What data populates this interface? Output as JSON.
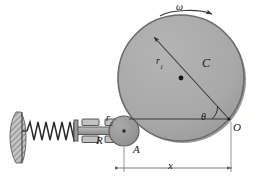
{
  "figure": {
    "background": "#ffffff",
    "width": 253,
    "height": 183
  },
  "colors": {
    "disc_fill": "#a9a9a9",
    "disc_edge": "#6e6e6e",
    "disc_shadow": "#8c8c8c",
    "roller_fill": "#9b9b9b",
    "rod_fill": "#a5a5a5",
    "rod_edge": "#555555",
    "block_fill": "#bdbdbd",
    "block_edge": "#4a4a4a",
    "wall_fill": "#bbbbbb",
    "wall_edge": "#555555",
    "spring_stroke": "#2b2b2b",
    "line_stroke": "#3a3a3a",
    "dim_stroke": "#6a6a6a",
    "text": "#1a1a1a"
  },
  "labels": {
    "omega": "ω",
    "r1_base": "r",
    "r1_sub": "1",
    "disc": "C",
    "theta": "θ",
    "origin": "O",
    "r2_base": "r",
    "r2_sub": "2",
    "rod": "R",
    "contact_point": "A",
    "displacement": "x"
  },
  "geometry": {
    "disc": {
      "cx": 181,
      "cy": 78,
      "r": 63
    },
    "disc_center_dot": {
      "cx": 181,
      "cy": 78,
      "r": 2
    },
    "point_O": {
      "x": 229,
      "y": 119
    },
    "roller": {
      "cx": 124,
      "cy": 131,
      "r": 15
    },
    "radius_line": {
      "x1": 152,
      "y1": 35,
      "x2": 229,
      "y2": 119
    },
    "chord_line": {
      "x1": 130,
      "y1": 119,
      "x2": 229,
      "y2": 119
    },
    "angle_arc_deg": 47,
    "omega_arrow": {
      "x1": 161,
      "y1": 13,
      "x2": 213,
      "y2": 13,
      "direction": "clockwise-right"
    },
    "dimension_x": {
      "x1": 119,
      "x2": 231,
      "y": 168
    },
    "guide_blocks": 4,
    "spring_coils": 8
  },
  "components": {
    "wall": "fixed-hatched-support",
    "spring": "helical-compression-spring",
    "rod": "horizontal-follower-rod",
    "guides": "roller-guide-blocks",
    "roller": "follower-roller-r2",
    "disc": "rotating-eccentric-disc-C"
  }
}
